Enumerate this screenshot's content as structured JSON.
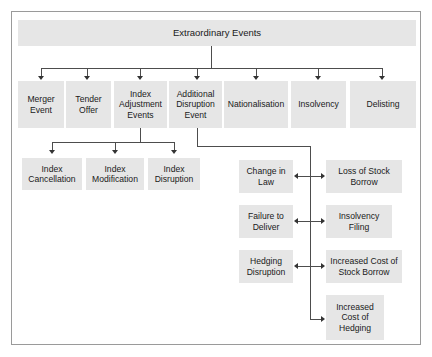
{
  "diagram": {
    "root": {
      "label": "Extraordinary Events"
    },
    "level1": [
      {
        "label": "Merger Event"
      },
      {
        "label": "Tender Offer"
      },
      {
        "label": "Index Adjustment Events"
      },
      {
        "label": "Additional Disruption Event"
      },
      {
        "label": "Nationalisation"
      },
      {
        "label": "Insolvency"
      },
      {
        "label": "Delisting"
      }
    ],
    "index_children": [
      {
        "label": "Index Cancellation"
      },
      {
        "label": "Index Modification"
      },
      {
        "label": "Index Disruption"
      }
    ],
    "disruption_left": [
      {
        "label": "Change in Law"
      },
      {
        "label": "Failure to Deliver"
      },
      {
        "label": "Hedging Disruption"
      }
    ],
    "disruption_right": [
      {
        "label": "Loss of Stock Borrow"
      },
      {
        "label": "Insolvency Filing"
      },
      {
        "label": "Increased Cost of Stock Borrow"
      },
      {
        "label": "Increased Cost of Hedging"
      }
    ],
    "colors": {
      "box_fill": "#e6e6e6",
      "frame_border": "#9a9a9a",
      "connector": "#4d4d4d",
      "text": "#1a1a1a",
      "background": "#ffffff"
    }
  }
}
